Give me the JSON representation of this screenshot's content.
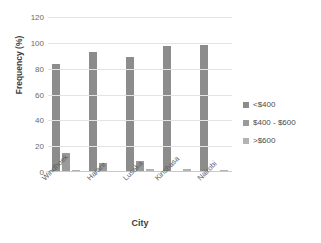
{
  "chart_data": {
    "type": "bar",
    "title": "",
    "xlabel": "City",
    "ylabel": "Frequency (%)",
    "categories": [
      "Windhoek",
      "Harare",
      "Lusaka",
      "Kinshasa",
      "Nairobi"
    ],
    "series": [
      {
        "name": "<$400",
        "values": [
          84,
          93,
          89,
          97.5,
          98.5
        ],
        "color": "#8c8c8c"
      },
      {
        "name": "$400 - $600",
        "values": [
          14.5,
          7,
          8.5,
          0,
          0
        ],
        "color": "#9a9a9a"
      },
      {
        "name": ">$600",
        "values": [
          1.5,
          0.5,
          2.5,
          2.5,
          1.5
        ],
        "color": "#b3b3b3"
      }
    ],
    "ylim": [
      0,
      120
    ],
    "yticks": [
      120,
      100,
      80,
      60,
      40,
      20,
      0
    ],
    "grid": true,
    "legend_position": "right"
  }
}
